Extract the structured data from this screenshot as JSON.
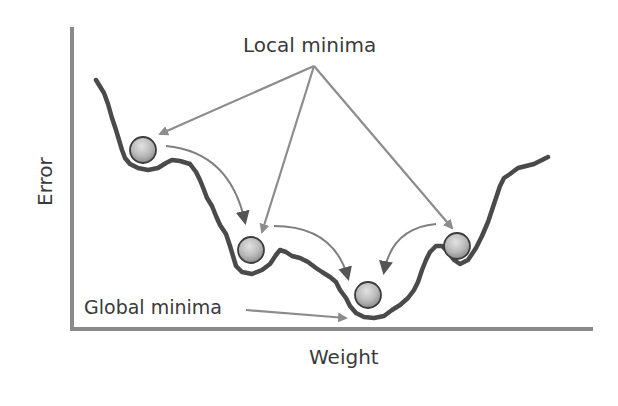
{
  "diagram": {
    "title": "Local minima",
    "y_axis_label": "Error",
    "x_axis_label": "Weight",
    "global_label": "Global minima",
    "balls": [
      {
        "name": "ball-local-1",
        "role": "local minimum",
        "cx": 143,
        "cy": 150
      },
      {
        "name": "ball-local-2",
        "role": "local minimum",
        "cx": 251,
        "cy": 250
      },
      {
        "name": "ball-global",
        "role": "global minimum",
        "cx": 368,
        "cy": 295
      },
      {
        "name": "ball-local-3",
        "role": "local minimum",
        "cx": 457,
        "cy": 246
      }
    ],
    "colors": {
      "curve": "#4a4a4a",
      "axis": "#8a8a8a",
      "arrow": "#8c8c8c",
      "ball_light": "#d6d6d6",
      "ball_dark": "#8f8f8f",
      "text": "#3a3a3a"
    }
  }
}
